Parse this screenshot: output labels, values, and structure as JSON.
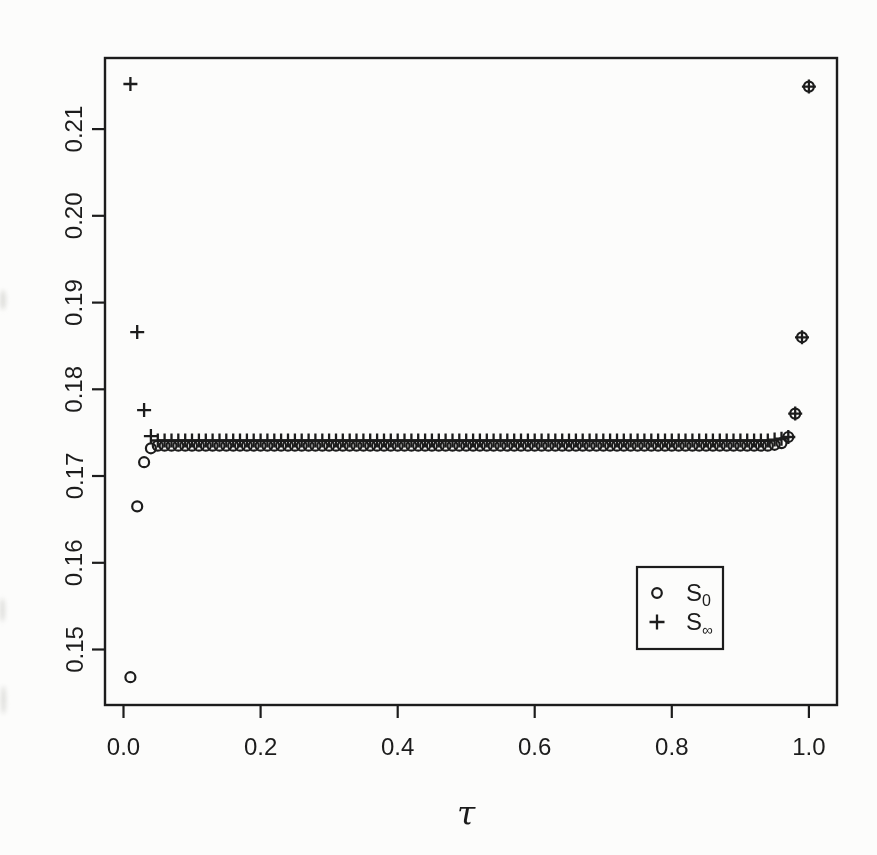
{
  "figure": {
    "width": 877,
    "height": 855,
    "background_color": "#fcfcfb",
    "ink_color": "#1c1c1c"
  },
  "chart_data": {
    "type": "scatter",
    "title": "",
    "xlabel": "τ",
    "ylabel": "",
    "grid": false,
    "xlim": [
      -0.027,
      1.041
    ],
    "ylim": [
      0.1436,
      0.2182
    ],
    "x_ticks": [
      0.0,
      0.2,
      0.4,
      0.6,
      0.8,
      1.0
    ],
    "x_tick_labels": [
      "0.0",
      "0.2",
      "0.4",
      "0.6",
      "0.8",
      "1.0"
    ],
    "y_ticks": [
      0.15,
      0.16,
      0.17,
      0.18,
      0.19,
      0.2,
      0.21
    ],
    "y_tick_labels": [
      "0.15",
      "0.16",
      "0.17",
      "0.18",
      "0.19",
      "0.20",
      "0.21"
    ],
    "legend": {
      "position": "lower-right",
      "border": true,
      "entries": [
        {
          "marker": "circle",
          "text": "S",
          "subscript": "0"
        },
        {
          "marker": "plus",
          "text": "S",
          "subscript": "∞"
        }
      ]
    },
    "series": [
      {
        "name": "S0",
        "marker": "circle",
        "x": [
          0.01,
          0.02,
          0.03,
          0.04,
          0.05,
          0.06,
          0.07,
          0.08,
          0.09,
          0.1,
          0.11,
          0.12,
          0.13,
          0.14,
          0.15,
          0.16,
          0.17,
          0.18,
          0.19,
          0.2,
          0.21,
          0.22,
          0.23,
          0.24,
          0.25,
          0.26,
          0.27,
          0.28,
          0.29,
          0.3,
          0.31,
          0.32,
          0.33,
          0.34,
          0.35,
          0.36,
          0.37,
          0.38,
          0.39,
          0.4,
          0.41,
          0.42,
          0.43,
          0.44,
          0.45,
          0.46,
          0.47,
          0.48,
          0.49,
          0.5,
          0.51,
          0.52,
          0.53,
          0.54,
          0.55,
          0.56,
          0.57,
          0.58,
          0.59,
          0.6,
          0.61,
          0.62,
          0.63,
          0.64,
          0.65,
          0.66,
          0.67,
          0.68,
          0.69,
          0.7,
          0.71,
          0.72,
          0.73,
          0.74,
          0.75,
          0.76,
          0.77,
          0.78,
          0.79,
          0.8,
          0.81,
          0.82,
          0.83,
          0.84,
          0.85,
          0.86,
          0.87,
          0.88,
          0.89,
          0.9,
          0.91,
          0.92,
          0.93,
          0.94,
          0.95,
          0.96,
          0.97,
          0.98,
          0.99,
          1.0
        ],
        "y": [
          0.1468,
          0.1665,
          0.1716,
          0.1732,
          0.1735,
          0.1735,
          0.1735,
          0.1735,
          0.1735,
          0.1735,
          0.1735,
          0.1735,
          0.1735,
          0.1735,
          0.1735,
          0.1735,
          0.1735,
          0.1735,
          0.1735,
          0.1735,
          0.1735,
          0.1735,
          0.1735,
          0.1735,
          0.1735,
          0.1735,
          0.1735,
          0.1735,
          0.1735,
          0.1735,
          0.1735,
          0.1735,
          0.1735,
          0.1735,
          0.1735,
          0.1735,
          0.1735,
          0.1735,
          0.1735,
          0.1735,
          0.1735,
          0.1735,
          0.1735,
          0.1735,
          0.1735,
          0.1735,
          0.1735,
          0.1735,
          0.1735,
          0.1735,
          0.1735,
          0.1735,
          0.1735,
          0.1735,
          0.1735,
          0.1735,
          0.1735,
          0.1735,
          0.1735,
          0.1735,
          0.1735,
          0.1735,
          0.1735,
          0.1735,
          0.1735,
          0.1735,
          0.1735,
          0.1735,
          0.1735,
          0.1735,
          0.1735,
          0.1735,
          0.1735,
          0.1735,
          0.1735,
          0.1735,
          0.1735,
          0.1735,
          0.1735,
          0.1735,
          0.1735,
          0.1735,
          0.1735,
          0.1735,
          0.1735,
          0.1735,
          0.1735,
          0.1735,
          0.1735,
          0.1735,
          0.1735,
          0.1735,
          0.1735,
          0.1735,
          0.1736,
          0.1738,
          0.1745,
          0.1772,
          0.186,
          0.2149
        ]
      },
      {
        "name": "Sinf",
        "marker": "plus",
        "x": [
          0.01,
          0.02,
          0.03,
          0.04,
          0.05,
          0.06,
          0.07,
          0.08,
          0.09,
          0.1,
          0.11,
          0.12,
          0.13,
          0.14,
          0.15,
          0.16,
          0.17,
          0.18,
          0.19,
          0.2,
          0.21,
          0.22,
          0.23,
          0.24,
          0.25,
          0.26,
          0.27,
          0.28,
          0.29,
          0.3,
          0.31,
          0.32,
          0.33,
          0.34,
          0.35,
          0.36,
          0.37,
          0.38,
          0.39,
          0.4,
          0.41,
          0.42,
          0.43,
          0.44,
          0.45,
          0.46,
          0.47,
          0.48,
          0.49,
          0.5,
          0.51,
          0.52,
          0.53,
          0.54,
          0.55,
          0.56,
          0.57,
          0.58,
          0.59,
          0.6,
          0.61,
          0.62,
          0.63,
          0.64,
          0.65,
          0.66,
          0.67,
          0.68,
          0.69,
          0.7,
          0.71,
          0.72,
          0.73,
          0.74,
          0.75,
          0.76,
          0.77,
          0.78,
          0.79,
          0.8,
          0.81,
          0.82,
          0.83,
          0.84,
          0.85,
          0.86,
          0.87,
          0.88,
          0.89,
          0.9,
          0.91,
          0.92,
          0.93,
          0.94,
          0.95,
          0.96,
          0.97,
          0.98,
          0.99,
          1.0
        ],
        "y": [
          0.2152,
          0.1866,
          0.1776,
          0.1746,
          0.1741,
          0.1741,
          0.1741,
          0.1741,
          0.1741,
          0.1741,
          0.1741,
          0.1741,
          0.1741,
          0.1741,
          0.1741,
          0.1741,
          0.1741,
          0.1741,
          0.1741,
          0.1741,
          0.1741,
          0.1741,
          0.1741,
          0.1741,
          0.1741,
          0.1741,
          0.1741,
          0.1741,
          0.1741,
          0.1741,
          0.1741,
          0.1741,
          0.1741,
          0.1741,
          0.1741,
          0.1741,
          0.1741,
          0.1741,
          0.1741,
          0.1741,
          0.1741,
          0.1741,
          0.1741,
          0.1741,
          0.1741,
          0.1741,
          0.1741,
          0.1741,
          0.1741,
          0.1741,
          0.1741,
          0.1741,
          0.1741,
          0.1741,
          0.1741,
          0.1741,
          0.1741,
          0.1741,
          0.1741,
          0.1741,
          0.1741,
          0.1741,
          0.1741,
          0.1741,
          0.1741,
          0.1741,
          0.1741,
          0.1741,
          0.1741,
          0.1741,
          0.1741,
          0.1741,
          0.1741,
          0.1741,
          0.1741,
          0.1741,
          0.1741,
          0.1741,
          0.1741,
          0.1741,
          0.1741,
          0.1741,
          0.1741,
          0.1741,
          0.1741,
          0.1741,
          0.1741,
          0.1741,
          0.1741,
          0.1741,
          0.1741,
          0.1741,
          0.1741,
          0.1741,
          0.1742,
          0.1743,
          0.1745,
          0.1772,
          0.186,
          0.2149
        ]
      }
    ]
  }
}
